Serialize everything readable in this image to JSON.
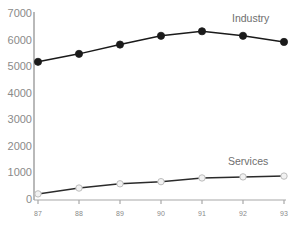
{
  "chart_data": {
    "type": "line",
    "title": "",
    "xlabel": "",
    "ylabel": "",
    "x": [
      "87",
      "88",
      "89",
      "90",
      "91",
      "92",
      "93"
    ],
    "categories": [
      "87",
      "88",
      "89",
      "90",
      "91",
      "92",
      "93"
    ],
    "ylim": [
      0,
      7000
    ],
    "y_ticks": [
      0,
      1000,
      2000,
      3000,
      4000,
      5000,
      6000,
      7000
    ],
    "y_tick_labels": [
      "0",
      "1000",
      "2000",
      "3000",
      "4000",
      "5000",
      "6000",
      "7000"
    ],
    "x_tick_labels": [
      "87",
      "88",
      "89",
      "90",
      "91",
      "92",
      "93"
    ],
    "grid": false,
    "legend_position": "inline-right",
    "series": [
      {
        "name": "Industry",
        "values": [
          5200,
          5500,
          5850,
          6180,
          6350,
          6180,
          5950
        ],
        "color": "#1a1a1a",
        "marker": "filled-circle",
        "marker_fill": "#1a1a1a",
        "marker_edge": "#1a1a1a",
        "label_x": 232,
        "label_y": 13
      },
      {
        "name": "Services",
        "values": [
          230,
          450,
          610,
          690,
          830,
          870,
          900
        ],
        "color": "#2b2b2b",
        "marker": "open-circle",
        "marker_fill": "#f2f2f2",
        "marker_edge": "#bdbdbd",
        "label_x": 228,
        "label_y": 156
      }
    ],
    "axis_color": "#a8a8a8",
    "tick_label_color": "#8a8a8a",
    "background": "#ffffff"
  }
}
